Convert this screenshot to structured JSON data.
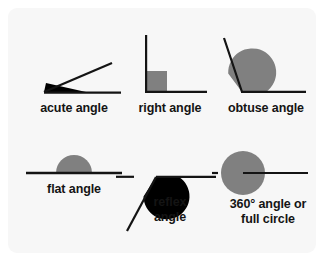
{
  "card": {
    "background_color": "#f7f7f7",
    "page_background_color": "#ffffff"
  },
  "style": {
    "line_color": "#141414",
    "gray_fill": "#808080",
    "black_fill": "#000000",
    "label_color": "#141414"
  },
  "diagrams": [
    {
      "id": "acute",
      "label": "acute angle",
      "marker_type": "filled-wedge",
      "marker_color": "#000000",
      "angle_degrees": 25
    },
    {
      "id": "right",
      "label": "right angle",
      "marker_type": "square",
      "marker_color": "#808080",
      "angle_degrees": 90
    },
    {
      "id": "obtuse",
      "label": "obtuse angle",
      "marker_type": "filled-sector",
      "marker_color": "#808080",
      "angle_degrees": 125
    },
    {
      "id": "flat",
      "label": "flat angle",
      "marker_type": "semicircle",
      "marker_color": "#808080",
      "angle_degrees": 180
    },
    {
      "id": "reflex",
      "label": "reflex\nangle",
      "marker_type": "filled-sector",
      "marker_color": "#000000",
      "angle_degrees": 240
    },
    {
      "id": "circle",
      "label": "360° angle or\nfull circle",
      "marker_type": "circle",
      "marker_color": "#808080",
      "angle_degrees": 360
    }
  ]
}
